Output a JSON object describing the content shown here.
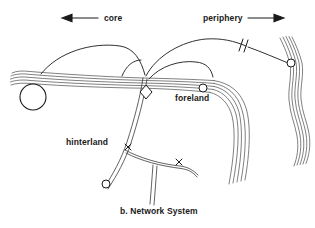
{
  "figure": {
    "caption": "b. Network System",
    "background_color": "#ffffff",
    "ink_color": "#1a1a1a",
    "width": 315,
    "height": 228
  },
  "axis_labels": {
    "core": {
      "text": "core",
      "arrow_direction": "left",
      "arrow_icon": "arrow-left-icon"
    },
    "periphery": {
      "text": "periphery",
      "arrow_direction": "right",
      "arrow_icon": "arrow-right-icon"
    }
  },
  "region_labels": {
    "foreland": "foreland",
    "hinterland": "hinterland"
  },
  "nodes": [
    {
      "name": "major-terminal-node",
      "shape": "circle",
      "cx": 33,
      "cy": 97,
      "r": 13
    },
    {
      "name": "interchange-node",
      "shape": "diamond",
      "cx": 146,
      "cy": 92,
      "r": 6
    },
    {
      "name": "foreland-node",
      "shape": "circle",
      "cx": 203,
      "cy": 88,
      "r": 4
    },
    {
      "name": "periphery-node",
      "shape": "circle",
      "cx": 291,
      "cy": 63,
      "r": 4
    },
    {
      "name": "hinterland-node",
      "shape": "circle",
      "cx": 106,
      "cy": 184,
      "r": 4
    }
  ],
  "markers": [
    {
      "name": "break-mark",
      "symbol": "//",
      "x": 242,
      "y": 45
    },
    {
      "name": "route-cut-mark-upper",
      "symbol": "x",
      "x": 128,
      "y": 147
    },
    {
      "name": "route-cut-mark-lower",
      "symbol": "x",
      "x": 179,
      "y": 162
    }
  ],
  "corridors": [
    {
      "name": "main-horizontal-corridor",
      "style": "multi-line-bundle",
      "lines": 5
    },
    {
      "name": "south-east-corridor",
      "style": "multi-line-bundle",
      "lines": 5
    },
    {
      "name": "right-vertical-corridor",
      "style": "multi-line-bundle",
      "lines": 5
    },
    {
      "name": "hinterland-corridor",
      "style": "double-line",
      "lines": 2
    },
    {
      "name": "hinterland-branch",
      "style": "double-line",
      "lines": 2
    },
    {
      "name": "hinterland-stub",
      "style": "double-line",
      "lines": 2
    },
    {
      "name": "core-arc-left",
      "style": "single-arc"
    },
    {
      "name": "core-arc-inner",
      "style": "single-arc"
    },
    {
      "name": "periphery-arc-upper",
      "style": "single-arc"
    },
    {
      "name": "periphery-arc-inner",
      "style": "single-arc"
    }
  ]
}
